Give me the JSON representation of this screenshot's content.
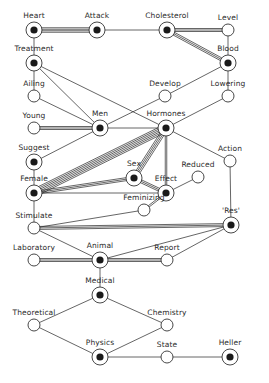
{
  "diagram": {
    "type": "word-association-network",
    "colors": {
      "line": "#333333",
      "node_fill": "#ffffff",
      "node_core": "#1a1a1a",
      "background": "#ffffff"
    },
    "nodes": [
      {
        "id": "heart",
        "label": "Heart",
        "x": 34,
        "y": 30,
        "filled": true
      },
      {
        "id": "attack",
        "label": "Attack",
        "x": 97,
        "y": 30,
        "filled": true
      },
      {
        "id": "cholesterol",
        "label": "Cholesterol",
        "x": 167,
        "y": 30,
        "filled": true
      },
      {
        "id": "level",
        "label": "Level",
        "x": 228,
        "y": 30,
        "filled": false
      },
      {
        "id": "treatment",
        "label": "Treatment",
        "x": 34,
        "y": 63,
        "filled": true
      },
      {
        "id": "blood",
        "label": "Blood",
        "x": 228,
        "y": 63,
        "filled": true
      },
      {
        "id": "ailing",
        "label": "Ailing",
        "x": 34,
        "y": 96,
        "filled": false
      },
      {
        "id": "develop",
        "label": "Develop",
        "x": 165,
        "y": 96,
        "filled": false
      },
      {
        "id": "lowering",
        "label": "Lowering",
        "x": 228,
        "y": 96,
        "filled": false
      },
      {
        "id": "young",
        "label": "Young",
        "x": 34,
        "y": 128,
        "filled": false
      },
      {
        "id": "men",
        "label": "Men",
        "x": 100,
        "y": 128,
        "filled": true
      },
      {
        "id": "hormones",
        "label": "Hormones",
        "x": 166,
        "y": 128,
        "filled": true
      },
      {
        "id": "suggest",
        "label": "Suggest",
        "x": 34,
        "y": 162,
        "filled": true
      },
      {
        "id": "sex",
        "label": "Sex",
        "x": 134,
        "y": 178,
        "filled": true
      },
      {
        "id": "effect",
        "label": "Effect",
        "x": 166,
        "y": 193,
        "filled": true
      },
      {
        "id": "reduced",
        "label": "Reduced",
        "x": 198,
        "y": 177,
        "filled": false
      },
      {
        "id": "action",
        "label": "Action",
        "x": 230,
        "y": 161,
        "filled": false
      },
      {
        "id": "female",
        "label": "Female",
        "x": 34,
        "y": 193,
        "filled": true
      },
      {
        "id": "feminizing",
        "label": "Feminizing",
        "x": 144,
        "y": 210,
        "filled": false
      },
      {
        "id": "stimulate",
        "label": "Stimulate",
        "x": 34,
        "y": 228,
        "filled": false
      },
      {
        "id": "res",
        "label": "'Res'",
        "x": 231,
        "y": 225,
        "filled": true
      },
      {
        "id": "laboratory",
        "label": "Laboratory",
        "x": 34,
        "y": 260,
        "filled": false
      },
      {
        "id": "animal",
        "label": "Animal",
        "x": 100,
        "y": 260,
        "filled": true
      },
      {
        "id": "report",
        "label": "Report",
        "x": 167,
        "y": 260,
        "filled": false
      },
      {
        "id": "medical",
        "label": "Medical",
        "x": 100,
        "y": 295,
        "filled": true
      },
      {
        "id": "theoretical",
        "label": "Theoretical",
        "x": 34,
        "y": 325,
        "filled": false
      },
      {
        "id": "chemistry",
        "label": "Chemistry",
        "x": 167,
        "y": 325,
        "filled": false
      },
      {
        "id": "physics",
        "label": "Physics",
        "x": 100,
        "y": 357,
        "filled": true
      },
      {
        "id": "state",
        "label": "State",
        "x": 167,
        "y": 357,
        "filled": false
      },
      {
        "id": "heller",
        "label": "Heller",
        "x": 230,
        "y": 357,
        "filled": true
      }
    ],
    "edges": [
      {
        "from": "heart",
        "to": "attack",
        "weight": 4
      },
      {
        "from": "heart",
        "to": "treatment",
        "weight": 1
      },
      {
        "from": "attack",
        "to": "cholesterol",
        "weight": 1
      },
      {
        "from": "cholesterol",
        "to": "level",
        "weight": 3
      },
      {
        "from": "cholesterol",
        "to": "blood",
        "weight": 3
      },
      {
        "from": "level",
        "to": "blood",
        "weight": 1
      },
      {
        "from": "blood",
        "to": "lowering",
        "weight": 1
      },
      {
        "from": "blood",
        "to": "develop",
        "weight": 1
      },
      {
        "from": "treatment",
        "to": "ailing",
        "weight": 1
      },
      {
        "from": "treatment",
        "to": "men",
        "weight": 1
      },
      {
        "from": "treatment",
        "to": "hormones",
        "weight": 1
      },
      {
        "from": "ailing",
        "to": "men",
        "weight": 1
      },
      {
        "from": "develop",
        "to": "men",
        "weight": 1
      },
      {
        "from": "lowering",
        "to": "hormones",
        "weight": 1
      },
      {
        "from": "young",
        "to": "men",
        "weight": 3
      },
      {
        "from": "men",
        "to": "hormones",
        "weight": 1
      },
      {
        "from": "men",
        "to": "suggest",
        "weight": 1
      },
      {
        "from": "hormones",
        "to": "female",
        "weight": 6
      },
      {
        "from": "hormones",
        "to": "sex",
        "weight": 4
      },
      {
        "from": "hormones",
        "to": "effect",
        "weight": 2
      },
      {
        "from": "hormones",
        "to": "action",
        "weight": 1
      },
      {
        "from": "suggest",
        "to": "female",
        "weight": 1
      },
      {
        "from": "female",
        "to": "sex",
        "weight": 3
      },
      {
        "from": "female",
        "to": "effect",
        "weight": 1
      },
      {
        "from": "female",
        "to": "stimulate",
        "weight": 1
      },
      {
        "from": "sex",
        "to": "effect",
        "weight": 3
      },
      {
        "from": "effect",
        "to": "reduced",
        "weight": 1
      },
      {
        "from": "effect",
        "to": "feminizing",
        "weight": 2
      },
      {
        "from": "action",
        "to": "res",
        "weight": 1
      },
      {
        "from": "stimulate",
        "to": "res",
        "weight": 3
      },
      {
        "from": "stimulate",
        "to": "feminizing",
        "weight": 1
      },
      {
        "from": "stimulate",
        "to": "animal",
        "weight": 1
      },
      {
        "from": "laboratory",
        "to": "animal",
        "weight": 3
      },
      {
        "from": "animal",
        "to": "report",
        "weight": 3
      },
      {
        "from": "animal",
        "to": "res",
        "weight": 1
      },
      {
        "from": "report",
        "to": "res",
        "weight": 1
      },
      {
        "from": "animal",
        "to": "medical",
        "weight": 1
      },
      {
        "from": "medical",
        "to": "theoretical",
        "weight": 1
      },
      {
        "from": "medical",
        "to": "chemistry",
        "weight": 1
      },
      {
        "from": "theoretical",
        "to": "physics",
        "weight": 1
      },
      {
        "from": "physics",
        "to": "chemistry",
        "weight": 1
      },
      {
        "from": "physics",
        "to": "state",
        "weight": 1
      },
      {
        "from": "state",
        "to": "heller",
        "weight": 1
      }
    ]
  }
}
